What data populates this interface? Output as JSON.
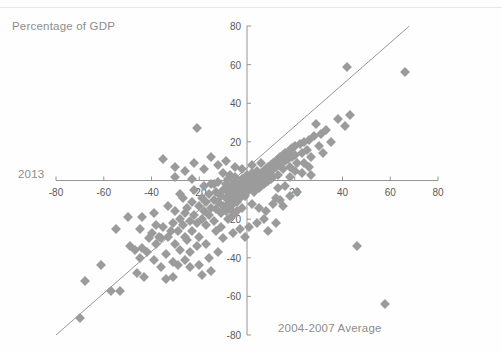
{
  "annotations": {
    "y_note": "Percentage of GDP",
    "y_axis_label": "2013",
    "x_axis_label": "2004-2007 Average"
  },
  "colors": {
    "marker": "#9b9b9b",
    "axis": "#8a8a8a",
    "trendline": "#8a8a8a",
    "label_text": "#8d8d8d",
    "tick_text": "#595959",
    "background": "#fefefe"
  },
  "chart_data": {
    "type": "scatter",
    "title": "",
    "xlabel": "2004-2007 Average",
    "ylabel": "2013",
    "subtitle": "Percentage of GDP",
    "xlim": [
      -80,
      80
    ],
    "ylim": [
      -80,
      80
    ],
    "xticks": [
      -80,
      -60,
      -40,
      -20,
      0,
      20,
      40,
      60,
      80
    ],
    "yticks": [
      -80,
      -60,
      -40,
      -20,
      0,
      20,
      40,
      60,
      80
    ],
    "grid": false,
    "legend": "none",
    "marker_shape": "diamond",
    "trendline": {
      "type": "linear",
      "x0": -80,
      "y0": -80,
      "x1": 68,
      "y1": 80
    },
    "points": [
      [
        -70,
        -71
      ],
      [
        -68,
        -52
      ],
      [
        -61,
        -44
      ],
      [
        -57,
        -57
      ],
      [
        -53,
        -57
      ],
      [
        -49,
        -34
      ],
      [
        -47,
        -36
      ],
      [
        -46,
        -48
      ],
      [
        -45,
        -40
      ],
      [
        -44,
        -35
      ],
      [
        -43,
        -50
      ],
      [
        -42,
        -37
      ],
      [
        -41,
        -30
      ],
      [
        -40,
        -27
      ],
      [
        -39,
        -41
      ],
      [
        -38,
        -33
      ],
      [
        -37,
        -29
      ],
      [
        -36,
        -30
      ],
      [
        -35,
        -24
      ],
      [
        -34,
        -38
      ],
      [
        -34,
        -51
      ],
      [
        -33,
        -29
      ],
      [
        -32,
        -26
      ],
      [
        -31,
        -22
      ],
      [
        -31,
        -50
      ],
      [
        -30,
        -33
      ],
      [
        -30,
        -16
      ],
      [
        -29,
        -26
      ],
      [
        -29,
        -44
      ],
      [
        -28,
        -20
      ],
      [
        -28,
        -36
      ],
      [
        -27,
        -23
      ],
      [
        -27,
        -9
      ],
      [
        -26,
        -29
      ],
      [
        -26,
        -17
      ],
      [
        -25,
        -14
      ],
      [
        -25,
        -31
      ],
      [
        -24,
        -21
      ],
      [
        -24,
        -37
      ],
      [
        -23,
        -11
      ],
      [
        -23,
        -26
      ],
      [
        -22,
        -18
      ],
      [
        -22,
        -5
      ],
      [
        -21,
        -22
      ],
      [
        -21,
        27
      ],
      [
        -20,
        -13
      ],
      [
        -20,
        -29
      ],
      [
        -19,
        -9
      ],
      [
        -19,
        -20
      ],
      [
        -18,
        -16
      ],
      [
        -18,
        -3
      ],
      [
        -17,
        -23
      ],
      [
        -17,
        -11
      ],
      [
        -16,
        -7
      ],
      [
        -16,
        -18
      ],
      [
        -15,
        -14
      ],
      [
        -15,
        -2
      ],
      [
        -14,
        -10
      ],
      [
        -14,
        -21
      ],
      [
        -13,
        -6
      ],
      [
        -13,
        -15
      ],
      [
        -12,
        -11
      ],
      [
        -12,
        -1
      ],
      [
        -11,
        -8
      ],
      [
        -11,
        -17
      ],
      [
        -10,
        -5
      ],
      [
        -10,
        -13
      ],
      [
        -10,
        4
      ],
      [
        -9,
        -9
      ],
      [
        -9,
        -2
      ],
      [
        -9,
        -16
      ],
      [
        -8,
        -6
      ],
      [
        -8,
        -12
      ],
      [
        -8,
        1
      ],
      [
        -7,
        -4
      ],
      [
        -7,
        -10
      ],
      [
        -7,
        -15
      ],
      [
        -6,
        -7
      ],
      [
        -6,
        -2
      ],
      [
        -6,
        -12
      ],
      [
        -5,
        -5
      ],
      [
        -5,
        -9
      ],
      [
        -5,
        2
      ],
      [
        -4,
        -3
      ],
      [
        -4,
        -7
      ],
      [
        -4,
        -11
      ],
      [
        -3,
        -1
      ],
      [
        -3,
        -5
      ],
      [
        -3,
        -9
      ],
      [
        -2,
        -3
      ],
      [
        -2,
        -6
      ],
      [
        -2,
        1
      ],
      [
        -1,
        -2
      ],
      [
        -1,
        -5
      ],
      [
        -1,
        -8
      ],
      [
        0,
        0
      ],
      [
        0,
        -3
      ],
      [
        0,
        -6
      ],
      [
        0,
        3
      ],
      [
        1,
        -1
      ],
      [
        1,
        -4
      ],
      [
        1,
        2
      ],
      [
        2,
        0
      ],
      [
        2,
        -3
      ],
      [
        2,
        4
      ],
      [
        3,
        1
      ],
      [
        3,
        -2
      ],
      [
        3,
        -6
      ],
      [
        4,
        2
      ],
      [
        4,
        -1
      ],
      [
        4,
        5
      ],
      [
        5,
        3
      ],
      [
        5,
        0
      ],
      [
        5,
        -4
      ],
      [
        6,
        4
      ],
      [
        6,
        1
      ],
      [
        6,
        -3
      ],
      [
        7,
        5
      ],
      [
        7,
        2
      ],
      [
        7,
        -2
      ],
      [
        8,
        6
      ],
      [
        8,
        3
      ],
      [
        8,
        -1
      ],
      [
        9,
        7
      ],
      [
        9,
        4
      ],
      [
        9,
        0
      ],
      [
        10,
        8
      ],
      [
        10,
        5
      ],
      [
        10,
        1
      ],
      [
        11,
        9
      ],
      [
        11,
        6
      ],
      [
        11,
        2
      ],
      [
        12,
        10
      ],
      [
        12,
        7
      ],
      [
        12,
        -9
      ],
      [
        13,
        11
      ],
      [
        13,
        8
      ],
      [
        13,
        3
      ],
      [
        14,
        12
      ],
      [
        14,
        9
      ],
      [
        15,
        13
      ],
      [
        15,
        6
      ],
      [
        15,
        -13
      ],
      [
        16,
        14
      ],
      [
        16,
        10
      ],
      [
        17,
        15
      ],
      [
        17,
        11
      ],
      [
        18,
        16
      ],
      [
        18,
        7
      ],
      [
        19,
        17
      ],
      [
        19,
        12
      ],
      [
        20,
        18
      ],
      [
        20,
        13
      ],
      [
        21,
        9
      ],
      [
        22,
        19
      ],
      [
        23,
        14
      ],
      [
        24,
        20
      ],
      [
        25,
        16
      ],
      [
        26,
        21
      ],
      [
        27,
        12
      ],
      [
        28,
        23
      ],
      [
        29,
        29
      ],
      [
        30,
        18
      ],
      [
        31,
        24
      ],
      [
        32,
        14
      ],
      [
        33,
        26
      ],
      [
        35,
        20
      ],
      [
        38,
        32
      ],
      [
        41,
        28
      ],
      [
        42,
        59
      ],
      [
        43,
        34
      ],
      [
        46,
        -34
      ],
      [
        58,
        -64
      ],
      [
        66,
        56
      ],
      [
        -35,
        11
      ],
      [
        -30,
        7
      ],
      [
        -26,
        5
      ],
      [
        -22,
        9
      ],
      [
        -18,
        6
      ],
      [
        -15,
        12
      ],
      [
        -12,
        8
      ],
      [
        -9,
        10
      ],
      [
        -44,
        -19
      ],
      [
        -39,
        -17
      ],
      [
        -33,
        -13
      ],
      [
        -28,
        -7
      ],
      [
        -21,
        -34
      ],
      [
        -17,
        -33
      ],
      [
        -13,
        -26
      ],
      [
        -11,
        -24
      ],
      [
        -8,
        -20
      ],
      [
        -6,
        -18
      ],
      [
        -4,
        -16
      ],
      [
        -2,
        -14
      ],
      [
        2,
        -12
      ],
      [
        5,
        -14
      ],
      [
        8,
        -16
      ],
      [
        11,
        -12
      ],
      [
        14,
        -10
      ],
      [
        4,
        -22
      ],
      [
        7,
        -20
      ],
      [
        1,
        -24
      ],
      [
        18,
        -8
      ],
      [
        21,
        -6
      ],
      [
        9,
        -26
      ],
      [
        12,
        -22
      ],
      [
        -50,
        -19
      ],
      [
        -55,
        -25
      ],
      [
        -45,
        -25
      ],
      [
        -38,
        -23
      ],
      [
        -31,
        -42
      ],
      [
        -36,
        -45
      ],
      [
        -26,
        -41
      ],
      [
        -24,
        -45
      ],
      [
        -20,
        -44
      ],
      [
        -16,
        -40
      ],
      [
        -12,
        -37
      ],
      [
        -19,
        -49
      ],
      [
        -15,
        -47
      ],
      [
        -10,
        -30
      ],
      [
        -6,
        -27
      ],
      [
        -3,
        -25
      ],
      [
        -1,
        -29
      ],
      [
        -14,
        -2
      ],
      [
        -7,
        3
      ],
      [
        -5,
        7
      ],
      [
        2,
        8
      ],
      [
        6,
        9
      ],
      [
        -30,
        2
      ],
      [
        -23,
        1
      ],
      [
        -2,
        6
      ],
      [
        18,
        2
      ],
      [
        23,
        4
      ],
      [
        26,
        7
      ],
      [
        13,
        -4
      ],
      [
        16,
        -3
      ],
      [
        20,
        5
      ],
      [
        24,
        9
      ],
      [
        27,
        3
      ]
    ]
  }
}
